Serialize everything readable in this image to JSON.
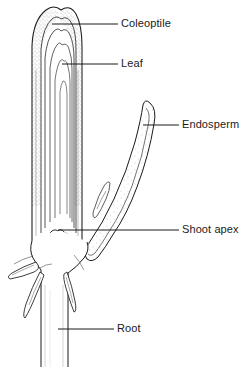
{
  "figure": {
    "background_color": "#ffffff",
    "ink_color": "#1a1a1a",
    "stipple_color": "#8a8a8a",
    "width": 247,
    "height": 367
  },
  "labels": {
    "coleoptile": "Coleoptile",
    "leaf": "Leaf",
    "endosperm": "Endosperm",
    "shoot_apex": "Shoot apex",
    "root": "Root"
  },
  "leader_lines": [
    {
      "name": "coleoptile",
      "x1": 52,
      "y1": 24,
      "x2": 118,
      "y2": 24
    },
    {
      "name": "leaf",
      "x1": 62,
      "y1": 64,
      "x2": 118,
      "y2": 64
    },
    {
      "name": "endosperm",
      "x1": 143,
      "y1": 125,
      "x2": 179,
      "y2": 125
    },
    {
      "name": "shoot_apex",
      "x1": 58,
      "y1": 230,
      "x2": 179,
      "y2": 230
    },
    {
      "name": "root",
      "x1": 58,
      "y1": 329,
      "x2": 114,
      "y2": 329
    }
  ],
  "structures": [
    {
      "name": "coleoptile",
      "description": "outer stippled sheath tapering to a point at the apex"
    },
    {
      "name": "leaf",
      "description": "nested inner leaf layers forming pointed arches"
    },
    {
      "name": "endosperm",
      "description": "curved scythe-shaped body with stippled interior at right"
    },
    {
      "name": "shoot-apex",
      "description": "small notch at the base of the shaft"
    },
    {
      "name": "root",
      "description": "vertical radicle descending with lateral pointed projections"
    }
  ]
}
